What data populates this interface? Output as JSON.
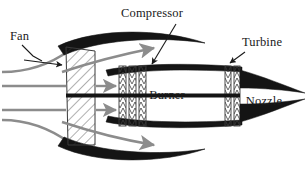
{
  "figure": {
    "background_color": "#ffffff",
    "ink_color": "#1a1a1a",
    "flow_color": "#8c8c8c",
    "hatch_color": "#3a3a3a"
  },
  "labels": [
    {
      "id": "fan",
      "text": "Fan",
      "x": 10,
      "y": 40,
      "anchor": "start",
      "has_leader": true
    },
    {
      "id": "compressor",
      "text": "Compressor",
      "x": 152,
      "y": 17,
      "anchor": "middle",
      "has_leader": true
    },
    {
      "id": "turbine",
      "text": "Turbine",
      "x": 262,
      "y": 46,
      "anchor": "middle",
      "has_leader": true
    },
    {
      "id": "burner",
      "text": "Burner",
      "x": 167,
      "y": 94,
      "anchor": "middle",
      "has_leader": false
    },
    {
      "id": "nozzle",
      "text": "Nozzle",
      "x": 262,
      "y": 104,
      "anchor": "middle",
      "has_leader": false
    }
  ],
  "components": {
    "fan_disc": {
      "name": "fan-disc",
      "stages": 1,
      "hatch": "diagonal"
    },
    "compressor": {
      "name": "compressor-stages",
      "stages": 3,
      "hatch": "chevron"
    },
    "turbine": {
      "name": "turbine-stages",
      "stages": 2,
      "hatch": "chevron"
    },
    "nacelle": {
      "name": "nacelle-cowling",
      "count": 2
    },
    "core_cowl": {
      "name": "core-cowl",
      "count": 2
    },
    "shaft": {
      "name": "engine-shaft",
      "count": 1
    },
    "nozzle_cone": {
      "name": "nozzle-cone",
      "count": 2
    }
  },
  "flow": {
    "inlet_streamlines": 4,
    "core_arrows": 2,
    "bypass_arrows": 2
  }
}
